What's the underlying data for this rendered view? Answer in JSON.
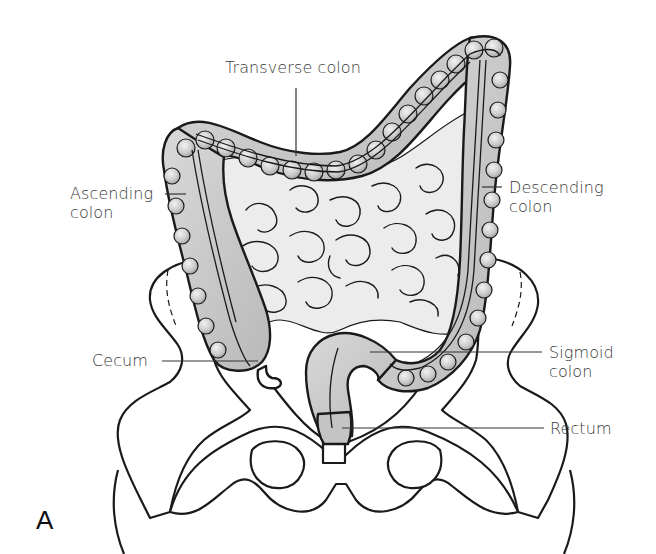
{
  "figure": {
    "panel_letter": "A"
  },
  "labels": {
    "transverse_colon": "Transverse colon",
    "ascending_colon": "Ascending\ncolon",
    "descending_colon": "Descending\ncolon",
    "cecum": "Cecum",
    "sigmoid_colon": "Sigmoid\ncolon",
    "rectum": "Rectum"
  },
  "colors": {
    "colon_fill": "#c8c8c8",
    "colon_highlight": "#e6e6e6",
    "small_intestine_fill": "#ececec",
    "outline": "#1a1a1a",
    "bone_fill": "#ffffff",
    "leader_line": "#333333",
    "text": "#3a3a3a"
  }
}
